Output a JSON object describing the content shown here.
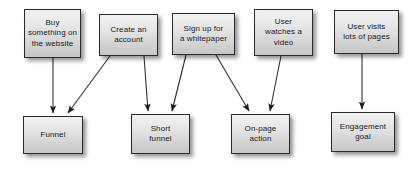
{
  "diagram": {
    "type": "flowchart",
    "canvas": {
      "width": 412,
      "height": 172
    },
    "style": {
      "box_fill_top": "#f2f2f2",
      "box_fill_bottom": "#c6c6c6",
      "box_border": "#2b2b2b",
      "text_color": "#1a1a1a",
      "arrow_color": "#333333",
      "background": "#ffffff"
    },
    "sources": [
      {
        "id": "buy",
        "label": "Buy\nsomething on\nthe website",
        "x": 24,
        "y": 9,
        "w": 57,
        "h": 49
      },
      {
        "id": "create-account",
        "label": "Create an\naccount",
        "x": 99,
        "y": 14,
        "w": 59,
        "h": 42
      },
      {
        "id": "whitepaper",
        "label": "Sign up for\na whitepaper",
        "x": 172,
        "y": 13,
        "w": 63,
        "h": 42
      },
      {
        "id": "video",
        "label": "User\nwatches a\nvideo",
        "x": 254,
        "y": 9,
        "w": 59,
        "h": 47
      },
      {
        "id": "pages",
        "label": "User visits\nlots of pages",
        "x": 334,
        "y": 10,
        "w": 65,
        "h": 44
      }
    ],
    "targets": [
      {
        "id": "funnel",
        "label": "Funnel",
        "x": 23,
        "y": 116,
        "w": 60,
        "h": 38
      },
      {
        "id": "short-funnel",
        "label": "Short\nfunnel",
        "x": 131,
        "y": 114,
        "w": 59,
        "h": 40
      },
      {
        "id": "on-page-action",
        "label": "On-page\naction",
        "x": 231,
        "y": 114,
        "w": 59,
        "h": 40
      },
      {
        "id": "engagement-goal",
        "label": "Engagement\ngoal",
        "x": 331,
        "y": 112,
        "w": 64,
        "h": 40
      }
    ],
    "edges": [
      {
        "id": "buy-to-funnel",
        "from": "buy",
        "to": "funnel",
        "x1": 53,
        "y1": 58,
        "x2": 53,
        "y2": 113
      },
      {
        "id": "create-account-to-funnel",
        "from": "create-account",
        "to": "funnel",
        "x1": 110,
        "y1": 56,
        "x2": 68,
        "y2": 113
      },
      {
        "id": "create-account-to-short-funnel",
        "from": "create-account",
        "to": "short-funnel",
        "x1": 144,
        "y1": 56,
        "x2": 148,
        "y2": 111
      },
      {
        "id": "whitepaper-to-short-funnel",
        "from": "whitepaper",
        "to": "short-funnel",
        "x1": 186,
        "y1": 55,
        "x2": 172,
        "y2": 111
      },
      {
        "id": "whitepaper-to-on-page-action",
        "from": "whitepaper",
        "to": "on-page-action",
        "x1": 216,
        "y1": 55,
        "x2": 249,
        "y2": 111
      },
      {
        "id": "video-to-on-page-action",
        "from": "video",
        "to": "on-page-action",
        "x1": 281,
        "y1": 56,
        "x2": 270,
        "y2": 111
      },
      {
        "id": "pages-to-engagement-goal",
        "from": "pages",
        "to": "engagement-goal",
        "x1": 362,
        "y1": 54,
        "x2": 362,
        "y2": 109
      }
    ]
  }
}
